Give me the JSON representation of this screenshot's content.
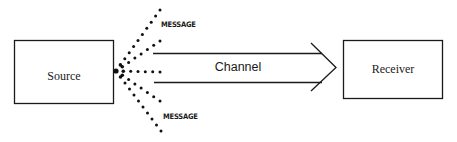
{
  "diagram": {
    "title": "",
    "nodes": {
      "source": {
        "label": "Source"
      },
      "receiver": {
        "label": "Receiver"
      }
    },
    "channel": {
      "label": "Channel"
    },
    "message_labels": {
      "top": "MESSAGE",
      "bottom": "MESSAGE"
    },
    "edges": [
      {
        "from": "source",
        "to": "receiver",
        "via": "channel",
        "style": "double-line-arrow"
      }
    ],
    "rays": {
      "count": 5,
      "style": "dotted"
    },
    "colors": {
      "ink": "#1a1a1a",
      "background": "#ffffff"
    }
  }
}
